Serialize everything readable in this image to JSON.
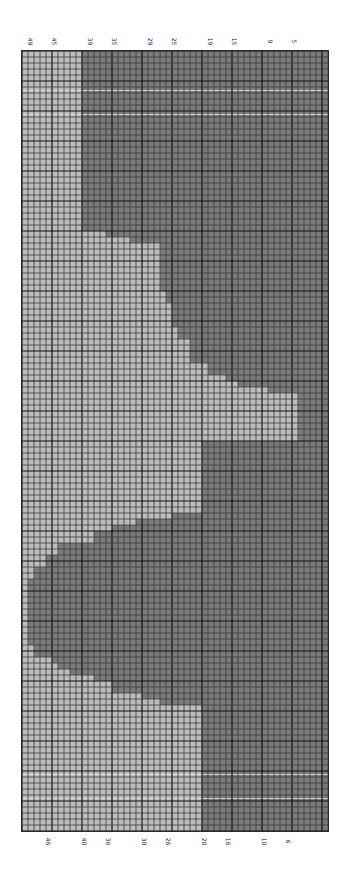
{
  "chart": {
    "columns": 51,
    "rows": 130,
    "cell_px": 6,
    "major_every": 5,
    "colors": {
      "background_cell": "#bdbdbd",
      "contrast_cell": "#7b7b7b",
      "minor_line": "#3a3a3a",
      "major_line": "#111111",
      "highlight_line": "#e4e4e4"
    },
    "highlight_rows": [
      6,
      10,
      120,
      124
    ],
    "top_labels": [
      {
        "text": "49",
        "col": 1
      },
      {
        "text": "45",
        "col": 5
      },
      {
        "text": "39",
        "col": 11
      },
      {
        "text": "35",
        "col": 15
      },
      {
        "text": "29",
        "col": 21
      },
      {
        "text": "25",
        "col": 25
      },
      {
        "text": "19",
        "col": 31
      },
      {
        "text": "15",
        "col": 35
      },
      {
        "text": "9",
        "col": 41
      },
      {
        "text": "5",
        "col": 45
      }
    ],
    "bottom_labels": [
      {
        "text": "46",
        "col": 4
      },
      {
        "text": "40",
        "col": 10
      },
      {
        "text": "36",
        "col": 14
      },
      {
        "text": "30",
        "col": 20
      },
      {
        "text": "26",
        "col": 24
      },
      {
        "text": "20",
        "col": 30
      },
      {
        "text": "16",
        "col": 34
      },
      {
        "text": "10",
        "col": 40
      },
      {
        "text": "6",
        "col": 44
      }
    ],
    "dark_runs": [
      [
        0,
        29,
        [
          [
            10,
            50
          ]
        ]
      ],
      [
        30,
        30,
        [
          [
            14,
            50
          ]
        ]
      ],
      [
        31,
        31,
        [
          [
            18,
            50
          ]
        ]
      ],
      [
        32,
        39,
        [
          [
            23,
            50
          ]
        ]
      ],
      [
        40,
        41,
        [
          [
            24,
            50
          ]
        ]
      ],
      [
        42,
        45,
        [
          [
            25,
            50
          ]
        ]
      ],
      [
        46,
        47,
        [
          [
            26,
            50
          ]
        ]
      ],
      [
        48,
        51,
        [
          [
            28,
            50
          ]
        ]
      ],
      [
        52,
        53,
        [
          [
            31,
            50
          ]
        ]
      ],
      [
        54,
        54,
        [
          [
            34,
            50
          ]
        ]
      ],
      [
        55,
        55,
        [
          [
            36,
            50
          ]
        ]
      ],
      [
        56,
        56,
        [
          [
            41,
            50
          ]
        ]
      ],
      [
        57,
        64,
        [
          [
            46,
            50
          ]
        ]
      ],
      [
        65,
        76,
        [
          [
            30,
            50
          ]
        ]
      ],
      [
        77,
        77,
        [
          [
            25,
            50
          ]
        ]
      ],
      [
        78,
        78,
        [
          [
            19,
            50
          ]
        ]
      ],
      [
        79,
        79,
        [
          [
            15,
            50
          ]
        ]
      ],
      [
        80,
        81,
        [
          [
            12,
            50
          ]
        ]
      ],
      [
        82,
        83,
        [
          [
            6,
            50
          ]
        ]
      ],
      [
        84,
        85,
        [
          [
            4,
            50
          ]
        ]
      ],
      [
        86,
        87,
        [
          [
            2,
            50
          ]
        ]
      ],
      [
        88,
        98,
        [
          [
            1,
            50
          ]
        ]
      ],
      [
        99,
        100,
        [
          [
            2,
            50
          ]
        ]
      ],
      [
        101,
        101,
        [
          [
            5,
            50
          ]
        ]
      ],
      [
        102,
        102,
        [
          [
            6,
            50
          ]
        ]
      ],
      [
        103,
        103,
        [
          [
            8,
            50
          ]
        ]
      ],
      [
        104,
        104,
        [
          [
            12,
            50
          ]
        ]
      ],
      [
        105,
        106,
        [
          [
            15,
            50
          ]
        ]
      ],
      [
        107,
        107,
        [
          [
            20,
            50
          ]
        ]
      ],
      [
        108,
        108,
        [
          [
            23,
            50
          ]
        ]
      ],
      [
        109,
        129,
        [
          [
            30,
            50
          ]
        ]
      ]
    ]
  }
}
